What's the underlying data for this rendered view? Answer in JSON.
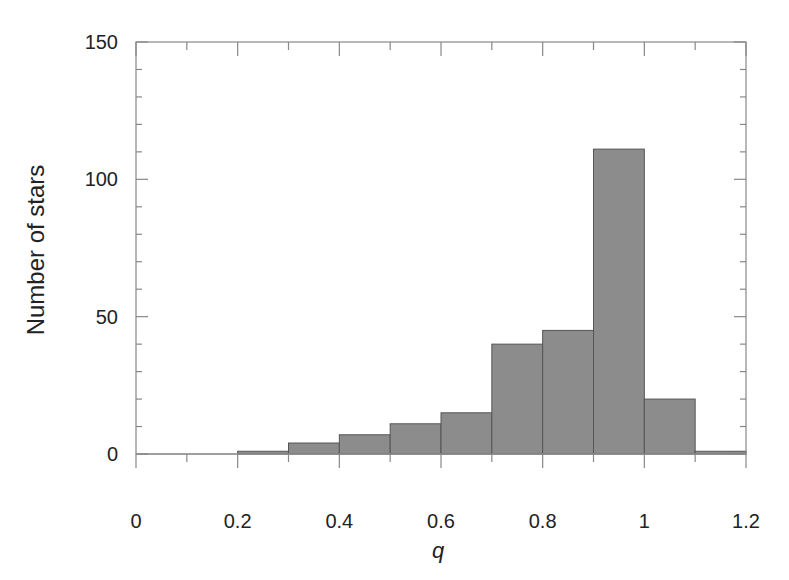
{
  "chart_data": {
    "type": "bar",
    "title": "",
    "xlabel": "q",
    "ylabel": "Number of stars",
    "xlim": [
      0,
      1.2
    ],
    "ylim": [
      0,
      150
    ],
    "x_ticks": [
      "0",
      "0.2",
      "0.4",
      "0.6",
      "0.8",
      "1",
      "1.2"
    ],
    "x_tick_values": [
      0,
      0.2,
      0.4,
      0.6,
      0.8,
      1.0,
      1.2
    ],
    "x_minor_step": 0.1,
    "y_ticks": [
      "0",
      "50",
      "100",
      "150"
    ],
    "y_tick_values": [
      0,
      50,
      100,
      150
    ],
    "y_minor_step": 10,
    "grid": false,
    "legend": null,
    "bin_width": 0.1,
    "categories": [
      "0.0-0.1",
      "0.1-0.2",
      "0.2-0.3",
      "0.3-0.4",
      "0.4-0.5",
      "0.5-0.6",
      "0.6-0.7",
      "0.7-0.8",
      "0.8-0.9",
      "0.9-1.0",
      "1.0-1.1",
      "1.1-1.2"
    ],
    "bin_edges": [
      0,
      0.1,
      0.2,
      0.3,
      0.4,
      0.5,
      0.6,
      0.7,
      0.8,
      0.9,
      1.0,
      1.1,
      1.2
    ],
    "values": [
      0,
      0,
      1,
      4,
      7,
      11,
      15,
      40,
      45,
      111,
      20,
      1
    ],
    "colors": {
      "bar_fill": "#8c8c8c",
      "bar_edge": "#555555",
      "axis": "#888888"
    }
  }
}
